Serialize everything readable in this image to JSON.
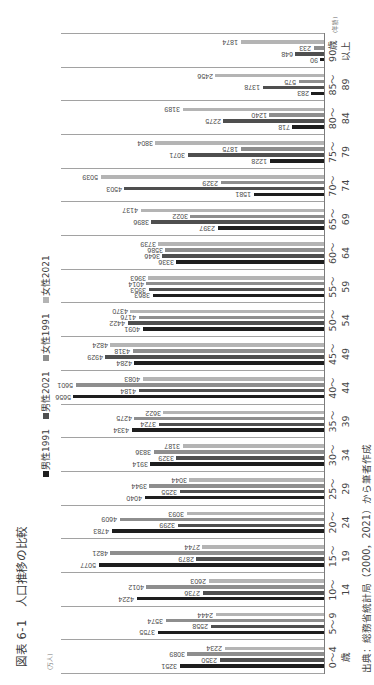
{
  "figure": {
    "title": "図表 6-1　人口推移の比較",
    "source": "出典：総務省統計局（2000，2021）から筆者作成"
  },
  "chart_data": {
    "type": "bar",
    "rotation": -90,
    "title": "図表 6-1　人口推移の比較",
    "xlabel": "(年齢)",
    "ylabel": "(万人)",
    "ylim": [
      0,
      6000
    ],
    "grid": false,
    "category_separators": true,
    "legend_position": "top",
    "value_labels": true,
    "categories": [
      "0～4歳",
      "5～9",
      "10～14",
      "15～19",
      "20～24",
      "25～29",
      "30～34",
      "35～39",
      "40～44",
      "45～49",
      "50～54",
      "55～59",
      "60～64",
      "65～69",
      "70～74",
      "75～79",
      "80～84",
      "85～89",
      "90歳以上"
    ],
    "category_label_lines": [
      [
        "0～4",
        "歳"
      ],
      [
        "5～9",
        ""
      ],
      [
        "10～",
        "14"
      ],
      [
        "15～",
        "19"
      ],
      [
        "20～",
        "24"
      ],
      [
        "25～",
        "29"
      ],
      [
        "30～",
        "34"
      ],
      [
        "35～",
        "39"
      ],
      [
        "40～",
        "44"
      ],
      [
        "45～",
        "49"
      ],
      [
        "50～",
        "54"
      ],
      [
        "55～",
        "59"
      ],
      [
        "60～",
        "64"
      ],
      [
        "65～",
        "69"
      ],
      [
        "70～",
        "74"
      ],
      [
        "75～",
        "79"
      ],
      [
        "80～",
        "84"
      ],
      [
        "85～",
        "89"
      ],
      [
        "90歳",
        "以上"
      ]
    ],
    "series": [
      {
        "key": "male-1991",
        "name": "男性1991",
        "color": "#1e1e1e",
        "values": [
          3251,
          3755,
          4224,
          5077,
          4783,
          4040,
          3914,
          4334,
          5656,
          4284,
          4091,
          3863,
          3336,
          2397,
          1581,
          1228,
          718,
          283,
          90
        ]
      },
      {
        "key": "male-2021",
        "name": "男性2021",
        "color": "#4f4f4f",
        "values": [
          2350,
          2558,
          2736,
          2879,
          3299,
          3255,
          3329,
          3724,
          4184,
          4929,
          4422,
          3953,
          3646,
          3896,
          4503,
          3071,
          2275,
          1378,
          648
        ]
      },
      {
        "key": "female-1991",
        "name": "女性1991",
        "color": "#8e8e8e",
        "values": [
          3089,
          3574,
          4012,
          4821,
          4609,
          3944,
          3836,
          4275,
          5601,
          4318,
          4176,
          4014,
          3586,
          3022,
          2329,
          1875,
          1240,
          575,
          233
        ]
      },
      {
        "key": "female-2021",
        "name": "女性2021",
        "color": "#b4b4b4",
        "values": [
          2234,
          2444,
          2603,
          2744,
          3093,
          3044,
          3187,
          3622,
          4083,
          4824,
          4370,
          3963,
          3739,
          4137,
          5039,
          3804,
          3189,
          2456,
          1874
        ]
      }
    ]
  }
}
